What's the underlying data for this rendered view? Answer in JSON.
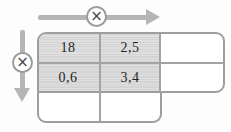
{
  "operators": {
    "horizontal": "×",
    "vertical": "×"
  },
  "table": {
    "rows": [
      {
        "cells": [
          "18",
          "2,5",
          ""
        ]
      },
      {
        "cells": [
          "0,6",
          "3,4",
          ""
        ]
      },
      {
        "cells": [
          "",
          ""
        ]
      }
    ]
  },
  "colors": {
    "arrow": "#b5b5b5",
    "table_border": "#9e9e9e",
    "divider": "#a3a3a3",
    "shaded_cell": "#d9d9d9",
    "text": "#1f1f1f"
  }
}
